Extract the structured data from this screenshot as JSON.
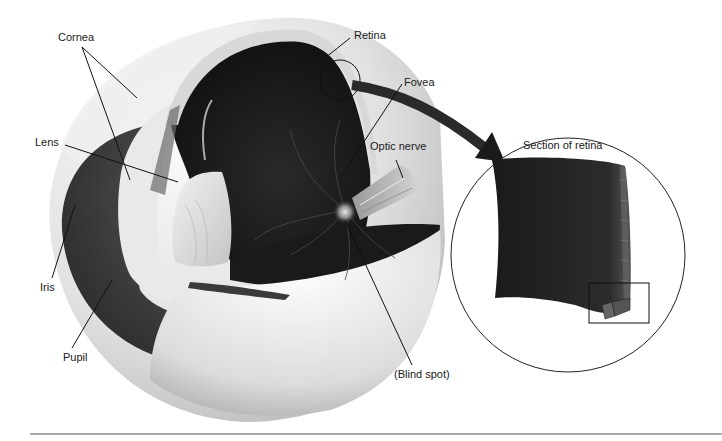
{
  "figure": {
    "colors": {
      "background": "#ffffff",
      "sclera": "#e6e6e6",
      "interior": "#1c1c1c",
      "iris": "#3a3a3a",
      "lens": "#d8d8d8",
      "arrow": "#2a2a2a",
      "line": "#111111"
    }
  },
  "labels": {
    "cornea": "Cornea",
    "lens": "Lens",
    "iris": "Iris",
    "pupil": "Pupil",
    "retina": "Retina",
    "fovea": "Fovea",
    "optic_nerve": "Optic nerve",
    "blind_spot": "(Blind spot)",
    "section_of_retina": "Section of retina"
  },
  "icons": {
    "arrow": "curved-arrow-to-inset",
    "inset_circle": "magnified-view-circle",
    "detail_box": "detail-rectangle"
  }
}
